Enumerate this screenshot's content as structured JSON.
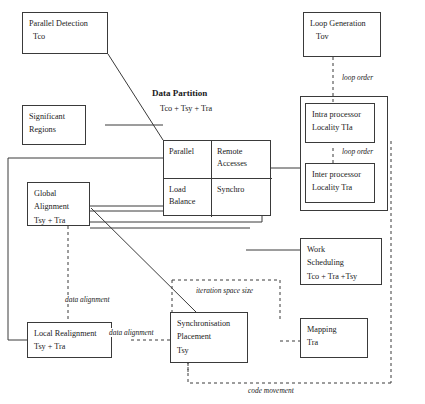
{
  "diagram": {
    "title": "Data Partition",
    "subtitle": "Tco + Tsy + Tra",
    "nodes": {
      "parallel_detection": {
        "line1": "Parallel Detection",
        "line2": "Tco"
      },
      "loop_generation": {
        "line1": "Loop Generation",
        "line2": "Tov"
      },
      "significant_regions": {
        "line1": "Significant",
        "line2": "Regions"
      },
      "intra_processor": {
        "line1": "Intra processor",
        "line2": "Locality   TIa"
      },
      "inter_processor": {
        "line1": "Inter processor",
        "line2": "Locality Tra"
      },
      "global_alignment": {
        "line1": "Global",
        "line2": "Alignment",
        "line3": "Tsy + Tra"
      },
      "work_scheduling": {
        "line1": "Work",
        "line2": "Scheduling",
        "line3": "Tco + Tra +Tsy"
      },
      "local_realignment": {
        "line1": "Local Realignment",
        "line2": "Tsy + Tra"
      },
      "synchronisation": {
        "line1": "Synchronisation",
        "line2": "Placement",
        "line3": "Tsy"
      },
      "mapping": {
        "line1": "Mapping",
        "line2": "Tra"
      }
    },
    "partition_cells": {
      "parallel": {
        "line1": "Parallel"
      },
      "remote_accesses": {
        "line1": "Remote",
        "line2": "Accesses"
      },
      "load_balance": {
        "line1": "Load",
        "line2": "Balance"
      },
      "synchro": {
        "line1": "Synchro"
      }
    },
    "edge_labels": {
      "loop_order_top": "loop order",
      "loop_order_mid": "loop order",
      "iteration_space_size": "iteration space size",
      "data_alignment_vertical": "data alignment",
      "data_alignment_horizontal": "data alignment",
      "code_movement": "code movement"
    },
    "colors": {
      "stroke": "#3a3a3a",
      "background": "#ffffff",
      "text": "#1a1a1a"
    }
  }
}
